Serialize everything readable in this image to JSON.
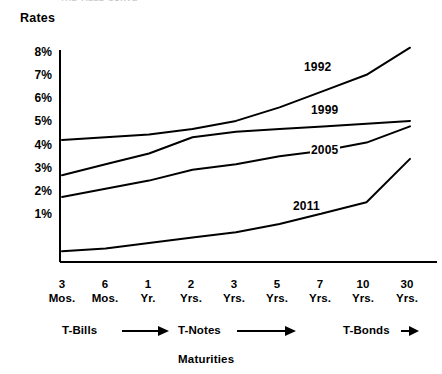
{
  "figure": {
    "clipped_title": "THE YIELD CURVE",
    "rates_axis_title": "Rates",
    "maturities_axis_title": "Maturities"
  },
  "bands": [
    {
      "name": "t-bills",
      "label": "T-Bills",
      "arrow": "→"
    },
    {
      "name": "t-notes",
      "label": "T-Notes",
      "arrow": "→"
    },
    {
      "name": "t-bonds",
      "label": "T-Bonds",
      "arrow": "→"
    }
  ],
  "chart_data": {
    "type": "line",
    "title": "THE YIELD CURVE",
    "xlabel": "Maturities",
    "ylabel": "Rates",
    "categories": [
      "3 Mos.",
      "6 Mos.",
      "1 Yr.",
      "2 Yrs.",
      "3 Yrs.",
      "5 Yrs.",
      "7 Yrs.",
      "10 Yrs.",
      "30 Yrs."
    ],
    "ytick_labels": [
      "8%",
      "7%",
      "6%",
      "5%",
      "4%",
      "3%",
      "2%",
      "1%"
    ],
    "ytick_values": [
      8,
      7,
      6,
      5,
      4,
      3,
      2,
      1
    ],
    "ylim": [
      0,
      8
    ],
    "grid": false,
    "legend": "inline-curve-labels",
    "series": [
      {
        "name": "1992",
        "values": [
          4.5,
          4.6,
          4.7,
          4.9,
          5.2,
          5.7,
          6.3,
          6.9,
          7.9
        ]
      },
      {
        "name": "1999",
        "values": [
          3.2,
          3.6,
          4.0,
          4.6,
          4.8,
          4.9,
          5.0,
          5.1,
          5.2
        ]
      },
      {
        "name": "2005",
        "values": [
          2.4,
          2.7,
          3.0,
          3.4,
          3.6,
          3.9,
          4.1,
          4.4,
          5.0
        ]
      },
      {
        "name": "2011",
        "values": [
          0.4,
          0.5,
          0.7,
          0.9,
          1.1,
          1.4,
          1.8,
          2.2,
          3.8
        ]
      }
    ]
  },
  "curve_labels": [
    {
      "name": "1992",
      "text": "1992"
    },
    {
      "name": "1999",
      "text": "1999"
    },
    {
      "name": "2005",
      "text": "2005"
    },
    {
      "name": "2011",
      "text": "2011"
    }
  ]
}
